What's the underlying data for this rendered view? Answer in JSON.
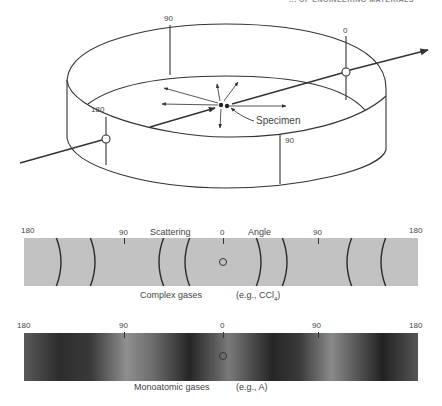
{
  "header": {
    "cutoff_text": "... OF ENGINEERING MATERIALS"
  },
  "cylinder": {
    "angle_labels": {
      "top_back": "90",
      "right_entry": "0",
      "left_exit": "180",
      "front": "90"
    },
    "specimen_label": "Specimen"
  },
  "complex_strip": {
    "axis_labels": {
      "left_end": "180",
      "left_mid": "90",
      "title_left": "Scattering",
      "center": "0",
      "title_right": "Angle",
      "right_mid": "90",
      "right_end": "180"
    },
    "caption_main": "Complex gases",
    "caption_example": "(e.g., CCl",
    "caption_example_sub": "4",
    "caption_example_close": ")",
    "background_color": "#c2c2c2",
    "line_color": "#2a2a2a"
  },
  "mono_strip": {
    "axis_labels": {
      "left_end": "180",
      "left_mid": "90",
      "center": "0",
      "right_mid": "90",
      "right_end": "180"
    },
    "caption_main": "Monoatomic gases",
    "caption_example": "(e.g., A)",
    "dark_color": "#262626",
    "light_color": "#8a8a8a"
  }
}
